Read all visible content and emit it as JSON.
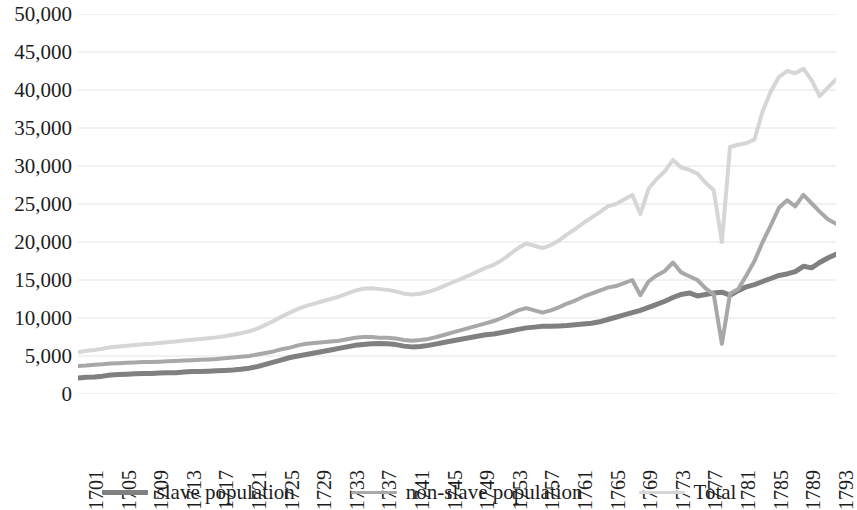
{
  "chart_data": {
    "type": "line",
    "title": "",
    "xlabel": "",
    "ylabel": "",
    "ylim": [
      0,
      50000
    ],
    "ytick_step": 5000,
    "grid": true,
    "legend_position": "bottom",
    "y_ticks": [
      "0",
      "5,000",
      "10,000",
      "15,000",
      "20,000",
      "25,000",
      "30,000",
      "35,000",
      "40,000",
      "45,000",
      "50,000"
    ],
    "x_tick_labels": [
      "1701",
      "1705",
      "1709",
      "1713",
      "1717",
      "1721",
      "1725",
      "1729",
      "1733",
      "1737",
      "1741",
      "1745",
      "1749",
      "1753",
      "1757",
      "1761",
      "1765",
      "1769",
      "1773",
      "1777",
      "1781",
      "1785",
      "1789",
      "1793"
    ],
    "x_start": 1701,
    "x_end": 1794,
    "x": [
      1701,
      1702,
      1703,
      1704,
      1705,
      1706,
      1707,
      1708,
      1709,
      1710,
      1711,
      1712,
      1713,
      1714,
      1715,
      1716,
      1717,
      1718,
      1719,
      1720,
      1721,
      1722,
      1723,
      1724,
      1725,
      1726,
      1727,
      1728,
      1729,
      1730,
      1731,
      1732,
      1733,
      1734,
      1735,
      1736,
      1737,
      1738,
      1739,
      1740,
      1741,
      1742,
      1743,
      1744,
      1745,
      1746,
      1747,
      1748,
      1749,
      1750,
      1751,
      1752,
      1753,
      1754,
      1755,
      1756,
      1757,
      1758,
      1759,
      1760,
      1761,
      1762,
      1763,
      1764,
      1765,
      1766,
      1767,
      1768,
      1769,
      1770,
      1771,
      1772,
      1773,
      1774,
      1775,
      1776,
      1777,
      1778,
      1779,
      1780,
      1781,
      1782,
      1783,
      1784,
      1785,
      1786,
      1787,
      1788,
      1789,
      1790,
      1791,
      1792,
      1793,
      1794
    ],
    "series": [
      {
        "name": "slave population",
        "color": "#808080",
        "width": 5,
        "values": [
          2100,
          2200,
          2250,
          2350,
          2500,
          2550,
          2600,
          2650,
          2700,
          2700,
          2750,
          2800,
          2800,
          2900,
          2950,
          2950,
          3000,
          3050,
          3100,
          3150,
          3250,
          3400,
          3600,
          3900,
          4200,
          4500,
          4800,
          5000,
          5200,
          5400,
          5600,
          5800,
          6000,
          6200,
          6400,
          6500,
          6600,
          6650,
          6600,
          6500,
          6300,
          6200,
          6250,
          6400,
          6600,
          6800,
          7000,
          7200,
          7400,
          7600,
          7800,
          7900,
          8100,
          8300,
          8500,
          8700,
          8800,
          8900,
          8900,
          8950,
          9000,
          9100,
          9200,
          9300,
          9500,
          9800,
          10100,
          10400,
          10700,
          11000,
          11400,
          11800,
          12200,
          12700,
          13100,
          13300,
          12900,
          13100,
          13300,
          13400,
          13000,
          13600,
          14100,
          14400,
          14800,
          15200,
          15600,
          15800,
          16100,
          16800,
          16600,
          17300,
          17900,
          18400
        ]
      },
      {
        "name": "non-slave population",
        "color": "#a8a8a8",
        "width": 4,
        "values": [
          3700,
          3750,
          3850,
          3900,
          4000,
          4050,
          4100,
          4150,
          4200,
          4200,
          4250,
          4300,
          4350,
          4400,
          4450,
          4500,
          4550,
          4600,
          4700,
          4800,
          4900,
          5000,
          5200,
          5400,
          5600,
          5900,
          6100,
          6400,
          6600,
          6700,
          6800,
          6900,
          7000,
          7200,
          7400,
          7500,
          7500,
          7400,
          7400,
          7300,
          7100,
          7000,
          7100,
          7250,
          7500,
          7800,
          8100,
          8400,
          8700,
          9000,
          9300,
          9600,
          10000,
          10500,
          11000,
          11300,
          11000,
          10700,
          11000,
          11400,
          11900,
          12300,
          12800,
          13200,
          13600,
          14000,
          14200,
          14600,
          15000,
          13000,
          14800,
          15600,
          16200,
          17300,
          16000,
          15500,
          15000,
          13900,
          13100,
          6600,
          13200,
          13800,
          15600,
          17500,
          20000,
          22200,
          24500,
          25500,
          24700,
          26200,
          25100,
          24000,
          23000,
          22400
        ]
      },
      {
        "name": "Total",
        "color": "#d6d6d6",
        "width": 4,
        "values": [
          5500,
          5700,
          5800,
          5950,
          6150,
          6250,
          6350,
          6450,
          6550,
          6600,
          6700,
          6800,
          6900,
          7050,
          7150,
          7250,
          7350,
          7450,
          7600,
          7800,
          8000,
          8250,
          8600,
          9100,
          9600,
          10200,
          10700,
          11200,
          11600,
          11900,
          12200,
          12500,
          12800,
          13200,
          13600,
          13850,
          13900,
          13800,
          13700,
          13500,
          13200,
          13100,
          13200,
          13450,
          13800,
          14250,
          14700,
          15150,
          15600,
          16100,
          16600,
          17000,
          17600,
          18400,
          19200,
          19800,
          19500,
          19200,
          19600,
          20200,
          21000,
          21700,
          22500,
          23200,
          23900,
          24700,
          25000,
          25600,
          26200,
          23700,
          27000,
          28300,
          29300,
          30800,
          29800,
          29500,
          29000,
          27800,
          26800,
          20000,
          32500,
          32800,
          33000,
          33500,
          37200,
          39800,
          41700,
          42500,
          42200,
          42800,
          41300,
          39200,
          40300,
          41400
        ]
      }
    ]
  },
  "legend": {
    "items": [
      {
        "label": "slave population",
        "swatch": "slave-population-swatch"
      },
      {
        "label": "non-slave population",
        "swatch": "non-slave-population-swatch"
      },
      {
        "label": "Total",
        "swatch": "total-swatch"
      }
    ]
  }
}
